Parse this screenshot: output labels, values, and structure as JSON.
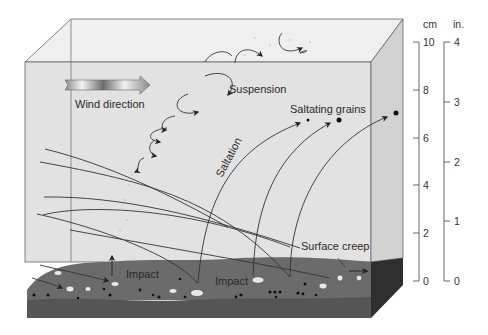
{
  "diagram": {
    "type": "sediment-transport-by-wind",
    "labels": {
      "wind_direction": "Wind direction",
      "suspension": "Suspension",
      "saltating_grains": "Saltating grains",
      "saltation": "Saltation",
      "impact_1": "Impact",
      "impact_2": "Impact",
      "surface_creep": "Surface creep"
    },
    "colors": {
      "box_face": "#e4e4e4",
      "box_top": "#f0f0f0",
      "box_side": "#d0d0d0",
      "soil_top": "#6a6a6a",
      "soil_front": "#555555",
      "soil_side": "#2e2e2e",
      "line": "#333333"
    }
  },
  "scales": {
    "cm": {
      "unit": "cm",
      "ticks": [
        "10",
        "8",
        "6",
        "4",
        "2",
        "0"
      ]
    },
    "in": {
      "unit": "in.",
      "ticks": [
        "4",
        "3",
        "2",
        "1",
        "0"
      ]
    }
  }
}
